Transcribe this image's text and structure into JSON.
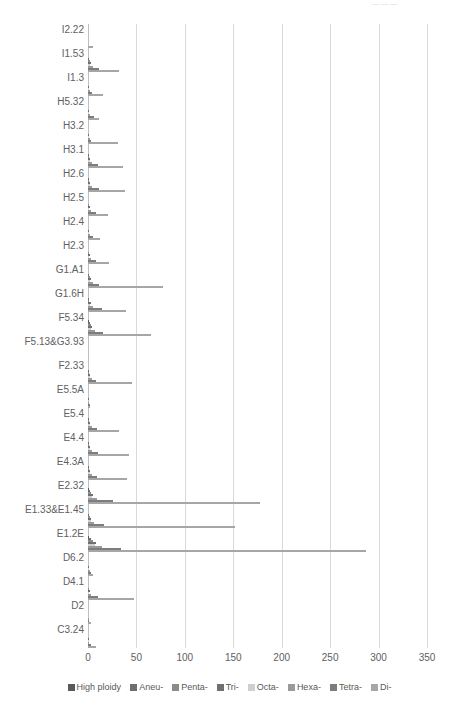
{
  "top_artifact": "— — —",
  "chart_data": {
    "type": "bar",
    "orientation": "horizontal",
    "title": "",
    "subtitle": "",
    "xlabel": "",
    "ylabel": "",
    "xlim": [
      0,
      350
    ],
    "xticks": [
      0,
      50,
      100,
      150,
      200,
      250,
      300,
      350
    ],
    "grid": true,
    "legend_position": "bottom",
    "categories": [
      "I2.22",
      "I1.53",
      "I1.3",
      "H5.32",
      "H3.2",
      "H3.1",
      "H2.6",
      "H2.5",
      "H2.4",
      "H2.3",
      "G1.A1",
      "G1.6H",
      "F5.34",
      "F5.13&G3.93",
      "F2.33",
      "E5.5A",
      "E5.4",
      "E4.4",
      "E4.3A",
      "E2.32",
      "E1.33&E1.45",
      "E1.2E",
      "D6.2",
      "D4.1",
      "D2",
      "C3.24"
    ],
    "series": [
      {
        "name": "High ploidy",
        "color": "#5a5a5a",
        "values": [
          0,
          0,
          0,
          0,
          0,
          0,
          0,
          0,
          0,
          0,
          0,
          0,
          1,
          0,
          0,
          0,
          0,
          0,
          0,
          1,
          0,
          1,
          0,
          0,
          0,
          0
        ]
      },
      {
        "name": "Aneu-",
        "color": "#6e6e6e",
        "values": [
          0,
          1,
          0,
          0,
          0,
          1,
          1,
          0,
          0,
          0,
          1,
          1,
          2,
          0,
          1,
          0,
          1,
          1,
          1,
          2,
          1,
          3,
          0,
          0,
          0,
          0
        ]
      },
      {
        "name": "Penta-",
        "color": "#8c8c8c",
        "values": [
          0,
          2,
          0,
          0,
          0,
          1,
          1,
          1,
          0,
          1,
          2,
          1,
          3,
          0,
          1,
          0,
          1,
          1,
          1,
          3,
          2,
          5,
          0,
          1,
          0,
          0
        ]
      },
      {
        "name": "Tri-",
        "color": "#707070",
        "values": [
          0,
          3,
          1,
          1,
          1,
          2,
          2,
          2,
          1,
          2,
          3,
          3,
          4,
          0,
          2,
          1,
          2,
          2,
          2,
          5,
          3,
          8,
          1,
          2,
          0,
          1
        ]
      },
      {
        "name": "Octa-",
        "color": "#cfcfcf",
        "values": [
          0,
          2,
          1,
          1,
          1,
          2,
          2,
          1,
          1,
          1,
          2,
          2,
          3,
          0,
          2,
          0,
          2,
          2,
          2,
          4,
          3,
          7,
          1,
          1,
          0,
          1
        ]
      },
      {
        "name": "Hexa-",
        "color": "#9a9a9a",
        "values": [
          0,
          5,
          2,
          2,
          2,
          4,
          4,
          3,
          2,
          3,
          5,
          5,
          7,
          0,
          4,
          1,
          4,
          4,
          4,
          9,
          6,
          14,
          2,
          3,
          1,
          1
        ]
      },
      {
        "name": "Tetra-",
        "color": "#7d7d7d",
        "values": [
          0,
          11,
          4,
          6,
          3,
          10,
          11,
          8,
          5,
          8,
          11,
          14,
          16,
          0,
          8,
          2,
          9,
          10,
          9,
          26,
          17,
          34,
          3,
          10,
          1,
          3
        ]
      },
      {
        "name": "Di-",
        "color": "#a6a6a6",
        "values": [
          5,
          32,
          15,
          11,
          31,
          36,
          38,
          21,
          12,
          22,
          77,
          39,
          65,
          0,
          45,
          2,
          32,
          42,
          40,
          178,
          152,
          287,
          5,
          48,
          3,
          8
        ]
      }
    ]
  },
  "legend": {
    "items": [
      {
        "label": "High ploidy",
        "color": "#5a5a5a"
      },
      {
        "label": "Aneu-",
        "color": "#6e6e6e"
      },
      {
        "label": "Penta-",
        "color": "#8c8c8c"
      },
      {
        "label": "Tri-",
        "color": "#707070"
      },
      {
        "label": "Octa-",
        "color": "#cfcfcf"
      },
      {
        "label": "Hexa-",
        "color": "#9a9a9a"
      },
      {
        "label": "Tetra-",
        "color": "#7d7d7d"
      },
      {
        "label": "Di-",
        "color": "#a6a6a6"
      }
    ]
  }
}
